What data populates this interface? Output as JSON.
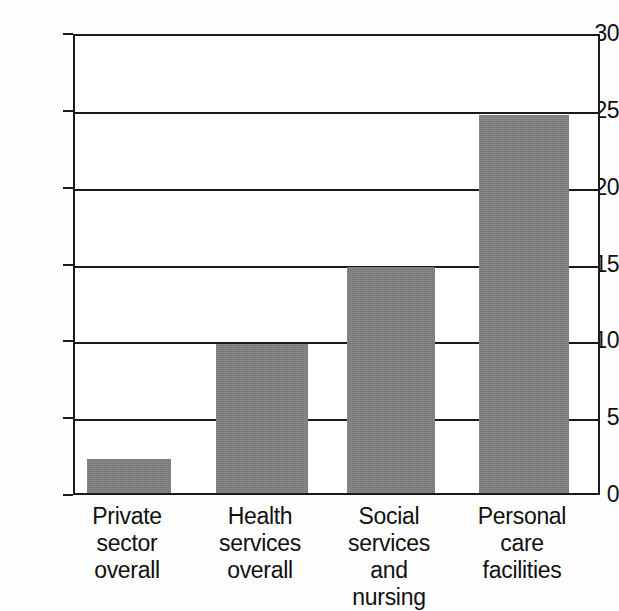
{
  "chart_data": {
    "type": "bar",
    "title": "",
    "subtitle": "",
    "xlabel": "",
    "ylabel": "",
    "categories": [
      "Private\nsector\noverall",
      "Health\nservices\noverall",
      "Social\nservices\nand\nnursing",
      "Personal\ncare\nfacilities"
    ],
    "values": [
      2.2,
      9.7,
      14.7,
      24.6
    ],
    "ylim": [
      0,
      30
    ],
    "ytick_labels": [
      "30",
      "25",
      "20",
      "15",
      "10",
      "5",
      "0"
    ],
    "ytick_values": [
      30,
      25,
      20,
      15,
      10,
      5,
      0
    ],
    "ytick_step": 5,
    "grid": true,
    "gridlines_at": [
      30,
      25,
      20,
      15,
      10,
      5,
      0
    ],
    "legend": "none",
    "legend_position": "none",
    "bar_color": "#808080",
    "frame_color": "#1a1a1a",
    "background_color": "#ffffff",
    "series": [
      {
        "name": "",
        "values": [
          2.2,
          9.7,
          14.7,
          24.6
        ]
      }
    ]
  },
  "figure": {
    "axis_label_color": "#111111"
  }
}
